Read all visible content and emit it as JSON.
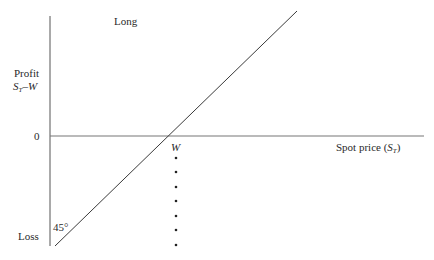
{
  "diagram": {
    "title": "Long",
    "y_axis": {
      "label_top": "Profit",
      "formula_s": "S",
      "formula_sub": "T",
      "formula_rest": "–W",
      "zero_label": "0",
      "bottom_label": "Loss"
    },
    "x_axis": {
      "label_prefix": "Spot price (",
      "label_s": "S",
      "label_sub": "T",
      "label_suffix": ")",
      "strike_label": "W"
    },
    "angle_label": "45°",
    "colors": {
      "line": "#3a3a3a",
      "axis": "#555555",
      "text": "#2a2a2a"
    }
  }
}
